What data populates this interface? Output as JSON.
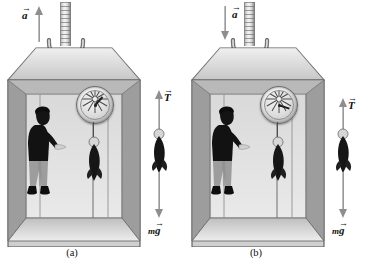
{
  "figure": {
    "background_color": "#ffffff",
    "panels": [
      {
        "id": "a",
        "caption": "(a)",
        "acceleration": {
          "label": "a",
          "direction": "up",
          "arrow_symbol": "→",
          "description": "elevator accelerating upward"
        },
        "free_body": {
          "tension": {
            "label": "T",
            "direction": "up",
            "arrow_symbol": "→"
          },
          "weight": {
            "label_m": "m",
            "label_g": "g",
            "direction": "down",
            "arrow_symbol": "→"
          }
        },
        "scene": {
          "cable_label": "cable",
          "car_label": "elevator car",
          "person_label": "person",
          "scale_label": "spring scale dial",
          "hanging_object_label": "fish"
        }
      },
      {
        "id": "b",
        "caption": "(b)",
        "acceleration": {
          "label": "a",
          "direction": "down",
          "arrow_symbol": "→",
          "description": "elevator accelerating downward"
        },
        "free_body": {
          "tension": {
            "label": "T",
            "direction": "up",
            "arrow_symbol": "→"
          },
          "weight": {
            "label_m": "m",
            "label_g": "g",
            "direction": "down",
            "arrow_symbol": "→"
          }
        },
        "scene": {
          "cable_label": "cable",
          "car_label": "elevator car",
          "person_label": "person",
          "scale_label": "spring scale dial",
          "hanging_object_label": "fish"
        }
      }
    ],
    "colors": {
      "car_wall": "#d3d3d3",
      "car_top": "#dedede",
      "car_floor": "#cfcfcf",
      "car_outline": "#5f5f5f",
      "cable_gray": "#c9c9c9",
      "arrow_gray": "#9a9a9a",
      "person_shirt": "#151515",
      "person_pants": "#9e9e9e",
      "fish": "#1b1b1b",
      "text": "#111111"
    }
  }
}
